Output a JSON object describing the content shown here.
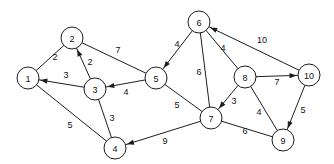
{
  "figure": {
    "type": "directed-weighted-graph-diagram",
    "background_color": "#ffffff",
    "stroke_color": "#1d1d1d",
    "text_color": "#111111",
    "width": 334,
    "height": 164
  },
  "chart_data": {
    "type": "diagram",
    "title": "",
    "xlabel": "",
    "ylabel": "",
    "grid": false,
    "legend": null,
    "nodes": [
      {
        "id": "n1",
        "label": "1",
        "x": 28,
        "y": 78,
        "r": 11
      },
      {
        "id": "n2",
        "label": "2",
        "x": 72,
        "y": 38,
        "r": 11
      },
      {
        "id": "n3",
        "label": "3",
        "x": 95,
        "y": 89,
        "r": 11
      },
      {
        "id": "n4",
        "label": "4",
        "x": 115,
        "y": 148,
        "r": 11
      },
      {
        "id": "n5",
        "label": "5",
        "x": 156,
        "y": 78,
        "r": 11
      },
      {
        "id": "n6",
        "label": "6",
        "x": 199,
        "y": 22,
        "r": 11
      },
      {
        "id": "n7",
        "label": "7",
        "x": 211,
        "y": 118,
        "r": 11
      },
      {
        "id": "n8",
        "label": "8",
        "x": 245,
        "y": 77,
        "r": 11
      },
      {
        "id": "n9",
        "label": "9",
        "x": 283,
        "y": 140,
        "r": 11
      },
      {
        "id": "n10",
        "label": "10",
        "x": 309,
        "y": 75,
        "r": 11
      }
    ],
    "edges": [
      {
        "id": "e-1-2",
        "from": "n1",
        "to": "n2",
        "weight": "2",
        "directed": false,
        "label_x": 55,
        "label_y": 57
      },
      {
        "id": "e-3-1",
        "from": "n3",
        "to": "n1",
        "weight": "3",
        "directed": true,
        "label_x": 66,
        "label_y": 75
      },
      {
        "id": "e-3-2",
        "from": "n3",
        "to": "n2",
        "weight": "2",
        "directed": true,
        "label_x": 90,
        "label_y": 62
      },
      {
        "id": "e-2-5",
        "from": "n2",
        "to": "n5",
        "weight": "7",
        "directed": false,
        "label_x": 118,
        "label_y": 50
      },
      {
        "id": "e-5-3",
        "from": "n5",
        "to": "n3",
        "weight": "4",
        "directed": true,
        "label_x": 126,
        "label_y": 92
      },
      {
        "id": "e-1-4",
        "from": "n1",
        "to": "n4",
        "weight": "5",
        "directed": false,
        "label_x": 70,
        "label_y": 125
      },
      {
        "id": "e-3-4",
        "from": "n3",
        "to": "n4",
        "weight": "3",
        "directed": false,
        "label_x": 112,
        "label_y": 118
      },
      {
        "id": "e-6-5",
        "from": "n6",
        "to": "n5",
        "weight": "4",
        "directed": true,
        "label_x": 177,
        "label_y": 44
      },
      {
        "id": "e-6-7",
        "from": "n6",
        "to": "n7",
        "weight": "6",
        "directed": false,
        "label_x": 199,
        "label_y": 72
      },
      {
        "id": "e-6-8",
        "from": "n6",
        "to": "n8",
        "weight": "4",
        "directed": false,
        "label_x": 223,
        "label_y": 48
      },
      {
        "id": "e-10-6",
        "from": "n10",
        "to": "n6",
        "weight": "10",
        "directed": true,
        "label_x": 262,
        "label_y": 40
      },
      {
        "id": "e-8-10",
        "from": "n8",
        "to": "n10",
        "weight": "7",
        "directed": true,
        "label_x": 277,
        "label_y": 82
      },
      {
        "id": "e-8-7",
        "from": "n8",
        "to": "n7",
        "weight": "3",
        "directed": true,
        "label_x": 234,
        "label_y": 101
      },
      {
        "id": "e-8-9",
        "from": "n8",
        "to": "n9",
        "weight": "4",
        "directed": false,
        "label_x": 259,
        "label_y": 112
      },
      {
        "id": "e-10-9",
        "from": "n10",
        "to": "n9",
        "weight": "5",
        "directed": true,
        "label_x": 303,
        "label_y": 110
      },
      {
        "id": "e-5-7",
        "from": "n5",
        "to": "n7",
        "weight": "5",
        "directed": false,
        "label_x": 177,
        "label_y": 105
      },
      {
        "id": "e-7-9",
        "from": "n7",
        "to": "n9",
        "weight": "6",
        "directed": false,
        "label_x": 245,
        "label_y": 131
      },
      {
        "id": "e-7-4",
        "from": "n7",
        "to": "n4",
        "weight": "9",
        "directed": true,
        "label_x": 165,
        "label_y": 141
      }
    ]
  }
}
